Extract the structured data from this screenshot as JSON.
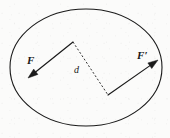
{
  "figure": {
    "background_color": "#fbfbfa",
    "stroke_color": "#1a1a1a",
    "caption": "",
    "boundary": {
      "shape": "ellipse",
      "cx": 86,
      "cy": 67.5,
      "rx": 76,
      "ry": 58.5,
      "stroke_width": 1.1
    },
    "labels": {
      "force_left": "F",
      "force_right": "F′",
      "distance": "d"
    },
    "vectors": [
      {
        "name": "force-left",
        "label": "F",
        "tail_x": 73,
        "tail_y": 42,
        "head_x": 28,
        "head_y": 78,
        "direction": "down-left"
      },
      {
        "name": "force-right",
        "label": "F′",
        "tail_x": 108,
        "tail_y": 95,
        "head_x": 158,
        "head_y": 60,
        "direction": "up-right"
      }
    ],
    "separation_line": {
      "name": "distance-d",
      "label": "d",
      "x1": 73,
      "y1": 42,
      "x2": 108,
      "y2": 95,
      "style": "dashed",
      "dash_pattern": "2,2"
    }
  }
}
